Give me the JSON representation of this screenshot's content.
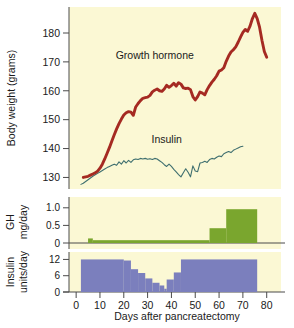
{
  "chart_data": {
    "type": "line",
    "title": "",
    "xlabel": "Days after pancreatectomy",
    "xlim": [
      -3,
      86
    ],
    "xticks": [
      0,
      10,
      20,
      30,
      40,
      50,
      60,
      70,
      80
    ],
    "grid": false,
    "legend_position": "inline-annotations",
    "panels": [
      {
        "name": "body-weight-panel",
        "type": "line",
        "ylabel": "Body weight (grams)",
        "ylim": [
          126,
          189
        ],
        "yticks": [
          130,
          140,
          150,
          160,
          170,
          180
        ],
        "annotations": [
          {
            "text": "Growth hormone",
            "x": 33,
            "y": 171
          },
          {
            "text": "Insulin",
            "x": 38,
            "y": 142
          }
        ],
        "series": [
          {
            "name": "Growth hormone",
            "color": "#a52a22",
            "x": [
              3,
              4,
              5,
              6,
              7,
              8,
              9,
              10,
              11,
              12,
              13,
              14,
              15,
              16,
              17,
              18,
              19,
              20,
              21,
              22,
              23,
              24,
              25,
              26,
              27,
              28,
              29,
              30,
              31,
              32,
              33,
              34,
              35,
              36,
              37,
              38,
              39,
              40,
              41,
              42,
              43,
              44,
              45,
              46,
              47,
              48,
              49,
              50,
              51,
              52,
              53,
              54,
              55,
              56,
              57,
              58,
              59,
              60,
              61,
              62,
              63,
              64,
              65,
              66,
              67,
              68,
              69,
              70,
              71,
              72,
              73,
              74,
              75,
              76,
              77,
              78,
              79,
              80
            ],
            "y": [
              130.0,
              130.2,
              130.4,
              130.8,
              131.2,
              131.6,
              132.2,
              133.2,
              134.6,
              136.4,
              138.4,
              140.4,
              142.6,
              144.8,
              146.8,
              148.6,
              150.2,
              151.6,
              152.4,
              152.8,
              152.6,
              151.5,
              154.4,
              155.6,
              156.6,
              157.4,
              157.6,
              157.8,
              158.4,
              159.6,
              160.2,
              160.6,
              160.0,
              159.8,
              160.6,
              161.9,
              161.2,
              161.8,
              162.6,
              161.6,
              162.8,
              162.3,
              161.0,
              160.8,
              160.9,
              160.4,
              158.0,
              156.8,
              158.0,
              159.6,
              159.2,
              158.6,
              160.4,
              161.8,
              163.0,
              164.0,
              165.2,
              166.8,
              167.2,
              168.0,
              170.2,
              172.0,
              173.4,
              174.2,
              175.2,
              176.8,
              178.6,
              180.2,
              181.2,
              180.6,
              182.4,
              185.0,
              186.8,
              185.0,
              182.0,
              177.5,
              173.6,
              171.6
            ]
          },
          {
            "name": "Insulin",
            "color": "#3f6f6f",
            "x": [
              2,
              3,
              4,
              5,
              6,
              7,
              8,
              9,
              10,
              11,
              12,
              13,
              14,
              15,
              16,
              17,
              18,
              19,
              20,
              21,
              22,
              23,
              24,
              25,
              26,
              27,
              28,
              29,
              30,
              31,
              32,
              33,
              34,
              35,
              36,
              37,
              38,
              39,
              40,
              41,
              42,
              43,
              44,
              45,
              46,
              47,
              48,
              49,
              50,
              51,
              52,
              53,
              54,
              55,
              56,
              57,
              58,
              59,
              60,
              61,
              62,
              63,
              64,
              65,
              66,
              67,
              68,
              69,
              70
            ],
            "y": [
              127.6,
              128.0,
              128.6,
              129.2,
              129.8,
              130.4,
              130.9,
              131.4,
              131.9,
              132.4,
              132.9,
              133.4,
              133.8,
              134.2,
              134.6,
              134.2,
              135.4,
              134.6,
              135.8,
              135.0,
              135.9,
              135.2,
              136.1,
              136.4,
              136.2,
              136.6,
              136.4,
              136.6,
              136.3,
              136.5,
              136.2,
              136.6,
              136.4,
              135.8,
              135.2,
              134.4,
              133.8,
              134.6,
              133.8,
              132.8,
              131.9,
              131.0,
              130.2,
              131.6,
              133.0,
              131.8,
              130.2,
              134.0,
              132.2,
              132.0,
              135.0,
              135.2,
              135.6,
              135.2,
              136.2,
              136.6,
              136.4,
              137.0,
              137.4,
              137.2,
              138.2,
              138.6,
              139.0,
              138.6,
              139.4,
              139.8,
              140.2,
              140.6,
              140.8
            ]
          }
        ]
      },
      {
        "name": "gh-dose-panel",
        "type": "bar",
        "ylabel_line1": "GH",
        "ylabel_line2": "mg/day",
        "ylim": [
          0,
          1.25
        ],
        "yticks": [
          0,
          0.5,
          1.0
        ],
        "bar_color": "#7aa62e",
        "bars": [
          {
            "x_start": 5,
            "x_end": 7,
            "value": 0.13
          },
          {
            "x_start": 7,
            "x_end": 56,
            "value": 0.08
          },
          {
            "x_start": 56,
            "x_end": 63,
            "value": 0.42
          },
          {
            "x_start": 63,
            "x_end": 76,
            "value": 0.96
          }
        ]
      },
      {
        "name": "insulin-dose-panel",
        "type": "bar",
        "ylabel_line1": "Insulin",
        "ylabel_line2": "units/day",
        "ylim": [
          0,
          14
        ],
        "yticks": [
          0,
          6,
          12
        ],
        "bar_color": "#7b7fbd",
        "bars": [
          {
            "x_start": 2,
            "x_end": 20,
            "value": 12
          },
          {
            "x_start": 20,
            "x_end": 23,
            "value": 11.6
          },
          {
            "x_start": 23,
            "x_end": 26,
            "value": 8.4
          },
          {
            "x_start": 26,
            "x_end": 29,
            "value": 7.0
          },
          {
            "x_start": 29,
            "x_end": 32,
            "value": 5.0
          },
          {
            "x_start": 32,
            "x_end": 35,
            "value": 3.4
          },
          {
            "x_start": 35,
            "x_end": 37,
            "value": 2.4
          },
          {
            "x_start": 37,
            "x_end": 38,
            "value": 1.2
          },
          {
            "x_start": 38,
            "x_end": 41,
            "value": 4.6
          },
          {
            "x_start": 41,
            "x_end": 44,
            "value": 7.2
          },
          {
            "x_start": 44,
            "x_end": 76,
            "value": 12
          }
        ]
      }
    ]
  },
  "labels": {
    "y_axis_main": "Body weight (grams)",
    "gh_line1": "GH",
    "gh_line2": "mg/day",
    "insulin_line1": "Insulin",
    "insulin_line2": "units/day",
    "x_axis": "Days after pancreatectomy",
    "annotation_gh": "Growth hormone",
    "annotation_insulin": "Insulin",
    "yt_130": "130",
    "yt_140": "140",
    "yt_150": "150",
    "yt_160": "160",
    "yt_170": "170",
    "yt_180": "180",
    "gh_t_0": "0",
    "gh_t_05": "0.5",
    "gh_t_10": "1.0",
    "ins_t_0": "0",
    "ins_t_6": "6",
    "ins_t_12": "12",
    "xt_0": "0",
    "xt_10": "10",
    "xt_20": "20",
    "xt_30": "30",
    "xt_40": "40",
    "xt_50": "50",
    "xt_60": "60",
    "xt_70": "70",
    "xt_80": "80"
  },
  "colors": {
    "plot_background": "#fbf8d4",
    "gh_curve": "#a52a22",
    "insulin_curve": "#3f6f6f",
    "gh_bar": "#7aa62e",
    "insulin_bar": "#7b7fbd",
    "axis": "#4a4a4a",
    "text": "#1a1a1a",
    "page_background": "#ffffff"
  }
}
